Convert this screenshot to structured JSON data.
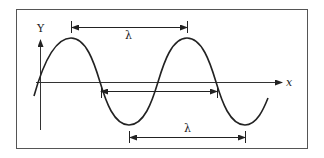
{
  "diagram": {
    "axes": {
      "y_label": "Y",
      "x_label": "x"
    },
    "wavelength_markers": [
      {
        "label": "λ",
        "from": "crest",
        "to": "crest",
        "position": "top"
      },
      {
        "label": "",
        "from": "zero-crossing",
        "to": "zero-crossing",
        "position": "middle"
      },
      {
        "label": "λ",
        "from": "trough",
        "to": "trough",
        "position": "bottom"
      }
    ],
    "colors": {
      "stroke": "#222222",
      "frame": "#555555",
      "background": "#ffffff"
    }
  }
}
